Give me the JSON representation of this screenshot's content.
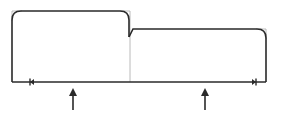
{
  "diagram": {
    "width": 282,
    "height": 116,
    "colors": {
      "stroke": "#2a2a2a",
      "construction": "#a8a8a8",
      "background": "#ffffff"
    },
    "shapes": [
      {
        "id": "left-block",
        "x": 12,
        "y": 11,
        "right": 130,
        "bottom": 82,
        "corner_radius": 9
      },
      {
        "id": "right-block",
        "x": 130,
        "y": 29,
        "right": 266,
        "bottom": 82,
        "corner_radius": 9,
        "notch_depth": 8
      }
    ],
    "baseline": {
      "y": 82,
      "x1": 12,
      "x2": 266
    },
    "markers": [
      {
        "id": "left-end-marker",
        "x": 31,
        "direction": "left"
      },
      {
        "id": "right-end-marker",
        "x": 255,
        "direction": "right"
      }
    ],
    "arrows": [
      {
        "id": "arrow-1",
        "x": 73,
        "y_tip": 88,
        "y_tail": 110,
        "direction": "up"
      },
      {
        "id": "arrow-2",
        "x": 205,
        "y_tip": 88,
        "y_tail": 110,
        "direction": "up"
      }
    ]
  }
}
